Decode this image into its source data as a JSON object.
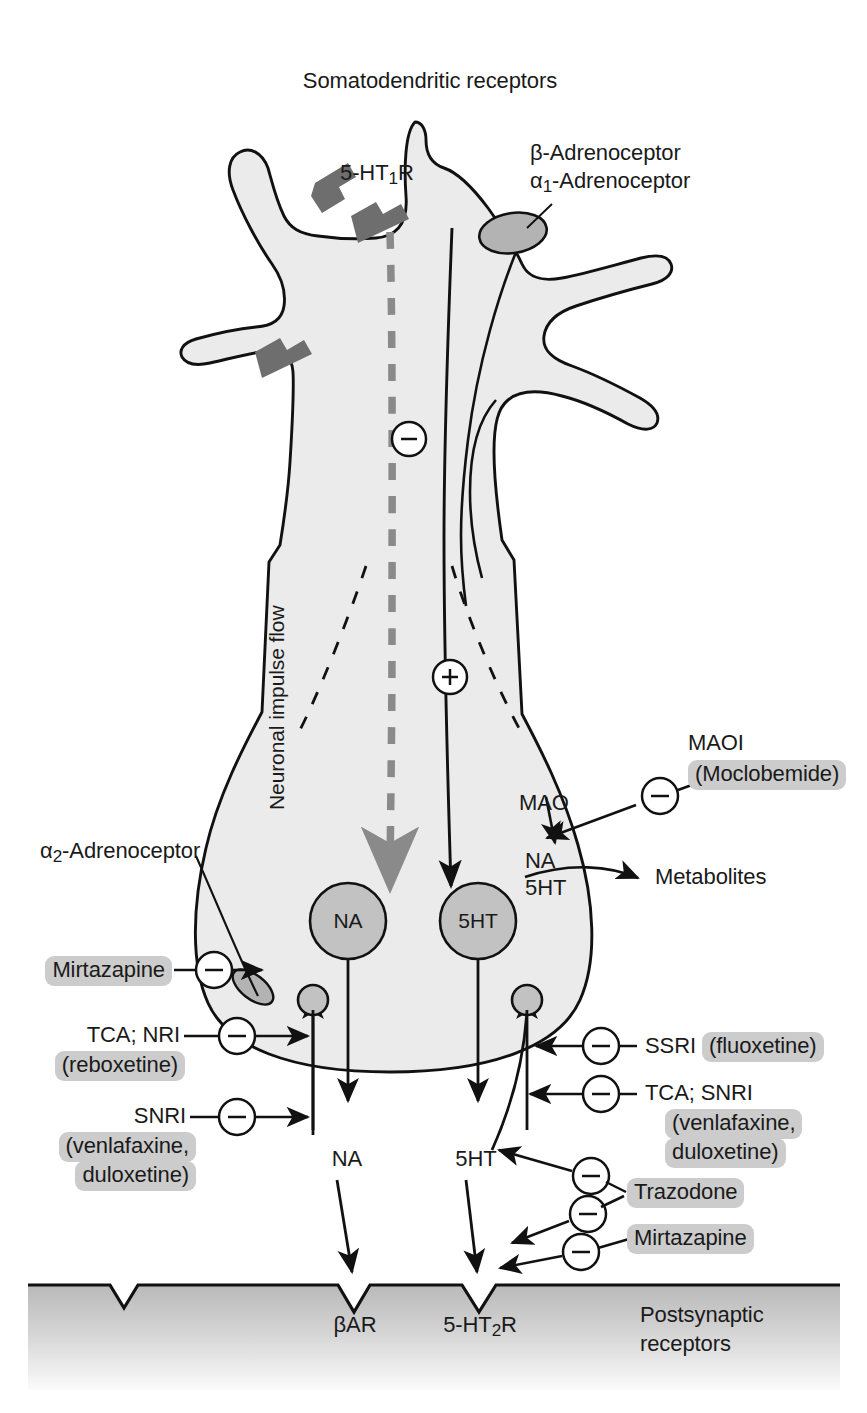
{
  "figure": {
    "title": "Somatodendritic receptors",
    "background_color": "#ffffff",
    "cell_fill": "#ebebeb",
    "receptor_fill": "#b3b3b3",
    "vesicle_fill": "#c2c2c2",
    "highlight_color": "#cccccc",
    "line_color": "#111111",
    "dashed_impulse_color": "#8a8a8a"
  },
  "labels": {
    "title": "Somatodendritic receptors",
    "ht1r": "5-HT",
    "ht1r_sub": "1",
    "ht1r_tail": "R",
    "beta_adrenoceptor": "β-Adrenoceptor",
    "alpha1_adrenoceptor_head": "α",
    "alpha1_adrenoceptor_sub": "1",
    "alpha1_adrenoceptor_tail": "-Adrenoceptor",
    "alpha2_adrenoceptor_head": "α",
    "alpha2_adrenoceptor_sub": "2",
    "alpha2_adrenoceptor_tail": "-Adrenoceptor",
    "impulse_flow": "Neuronal impulse flow",
    "minus_sign": "–",
    "plus_sign": "+",
    "mao": "MAO",
    "maoi": "MAOI",
    "moclobemide": "(Moclobemide)",
    "na_5ht_line1": "NA",
    "na_5ht_line2": "5HT",
    "metabolites": "Metabolites",
    "vesicle_na": "NA",
    "vesicle_5ht": "5HT",
    "cleft_na": "NA",
    "cleft_5ht": "5HT",
    "mirtazapine_left": "Mirtazapine",
    "tca_nri": "TCA; NRI",
    "reboxetine": "(reboxetine)",
    "snri_left": "SNRI",
    "venlafaxine_duloxetine_left_line1": "(venlafaxine,",
    "venlafaxine_duloxetine_left_line2": "duloxetine)",
    "ssri_prefix": "SSRI ",
    "ssri_drug": "(fluoxetine)",
    "tca_snri_right": "TCA; SNRI",
    "venlafaxine_duloxetine_right_line1": "(venlafaxine,",
    "venlafaxine_duloxetine_right_line2": "duloxetine)",
    "trazodone": "Trazodone",
    "mirtazapine_right": "Mirtazapine",
    "bar_receptor": "βAR",
    "ht2r_head": "5-HT",
    "ht2r_sub": "2",
    "ht2r_tail": "R",
    "postsynaptic_line1": "Postsynaptic",
    "postsynaptic_line2": "receptors"
  },
  "icons": {
    "inhibition": "minus-circle-icon",
    "excitation": "plus-circle-icon",
    "receptor_patch": "receptor-patch-icon",
    "transporter": "transporter-icon"
  }
}
